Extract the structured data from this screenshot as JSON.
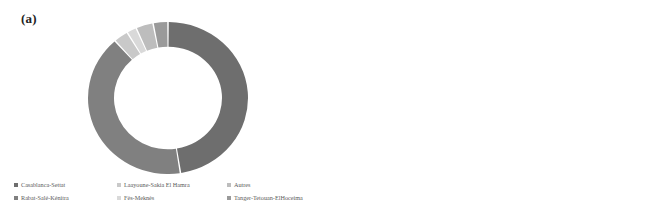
{
  "figure": {
    "panel_a_tag": "(a)",
    "panel_b_tag": "(b)"
  },
  "chart_data": [
    {
      "type": "pie",
      "variant": "donut",
      "panel": "(a)",
      "title": "",
      "legend_position": "bottom",
      "labels": [
        "Casablanca-Settat",
        "Rabat-Salé-Kénitra",
        "Laayoune-Sakia El Hamra",
        "Fès-Meknès",
        "Autres",
        "Tanger-Tetouan-ElHoceima"
      ],
      "values": [
        47.5,
        41.0,
        3.0,
        2.0,
        3.5,
        3.0
      ],
      "colors": [
        "#6e6e6e",
        "#808080",
        "#c9c9c9",
        "#d9d9d9",
        "#bdbdbd",
        "#9a9a9a"
      ],
      "legend": [
        {
          "label": "Casablanca-Settat",
          "color": "#6e6e6e"
        },
        {
          "label": "Laayoune-Sakia El Hamra",
          "color": "#c9c9c9"
        },
        {
          "label": "Autres",
          "color": "#bdbdbd"
        },
        {
          "label": "Rabat-Salé-Kénitra",
          "color": "#808080"
        },
        {
          "label": "Fès-Meknès",
          "color": "#d9d9d9"
        },
        {
          "label": "Tanger-Tetouan-ElHoceima",
          "color": "#9a9a9a"
        }
      ]
    },
    {
      "type": "bar",
      "orientation": "horizontal",
      "panel": "(b)",
      "title": "",
      "xlabel": "",
      "ylabel": "",
      "xlim": [
        0,
        40
      ],
      "grid": false,
      "xticks": [
        "0",
        "5",
        "10",
        "15",
        "20",
        "25",
        "30",
        "35",
        "40"
      ],
      "xtick_values": [
        0,
        5,
        10,
        15,
        20,
        25,
        30,
        35,
        40
      ],
      "categories": [
        "Other",
        "Services",
        "Healthcare",
        "Shipping industry",
        "Textile",
        "Automotive Industry",
        "Food industry"
      ],
      "values": [
        9.0,
        2.5,
        8.3,
        5.0,
        21.3,
        16.0,
        36.5
      ],
      "colors": [
        "#4e4e4e",
        "#b0b0b0",
        "#bcbcbc",
        "#5f5f5f",
        "#cccccc",
        "#5a5a5a",
        "#8a8a8a"
      ],
      "legend_position": "bottom",
      "legend": [
        {
          "label": "Other",
          "color": "#4e4e4e"
        },
        {
          "label": "Services",
          "color": "#b0b0b0"
        },
        {
          "label": "Healthcare",
          "color": "#bcbcbc"
        },
        {
          "label": "Shipping industry",
          "color": "#5f5f5f"
        },
        {
          "label": "Textile",
          "color": "#cccccc"
        },
        {
          "label": "Automotive Industry",
          "color": "#5a5a5a"
        },
        {
          "label": "Food industry",
          "color": "#8a8a8a"
        }
      ]
    }
  ]
}
